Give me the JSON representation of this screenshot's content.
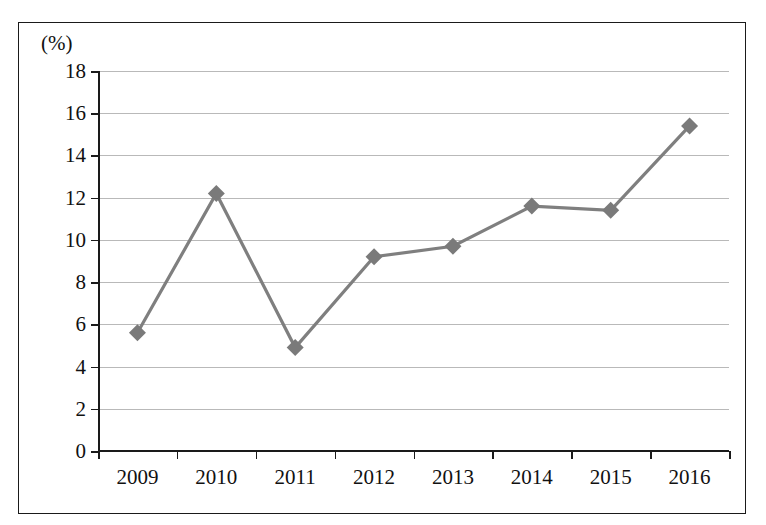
{
  "chart_data": {
    "type": "line",
    "title": "",
    "subtitle": "",
    "xlabel": "",
    "ylabel": "(%)",
    "unit_label": "(%)",
    "categories": [
      "2009",
      "2010",
      "2011",
      "2012",
      "2013",
      "2014",
      "2015",
      "2016"
    ],
    "values": [
      5.6,
      12.2,
      4.9,
      9.2,
      9.7,
      11.6,
      11.4,
      15.4
    ],
    "series": [
      {
        "name": "",
        "values": [
          5.6,
          12.2,
          4.9,
          9.2,
          9.7,
          11.6,
          11.4,
          15.4
        ]
      }
    ],
    "ylim": [
      0,
      18
    ],
    "ytick_step": 2,
    "yticks": [
      "18",
      "16",
      "14",
      "12",
      "10",
      "8",
      "6",
      "4",
      "2",
      "0"
    ],
    "ytick_values": [
      18,
      16,
      14,
      12,
      10,
      8,
      6,
      4,
      2,
      0
    ],
    "grid": true,
    "grid_axis": "y",
    "legend": false,
    "legend_position": "none",
    "marker": "diamond",
    "colors": {
      "line": "#7f7f7f",
      "marker": "#7a7a7a",
      "gridline": "#b9b9b9",
      "axis": "#1a1a1a",
      "text": "#111111",
      "background": "#ffffff",
      "border": "#1a1a1a"
    }
  }
}
